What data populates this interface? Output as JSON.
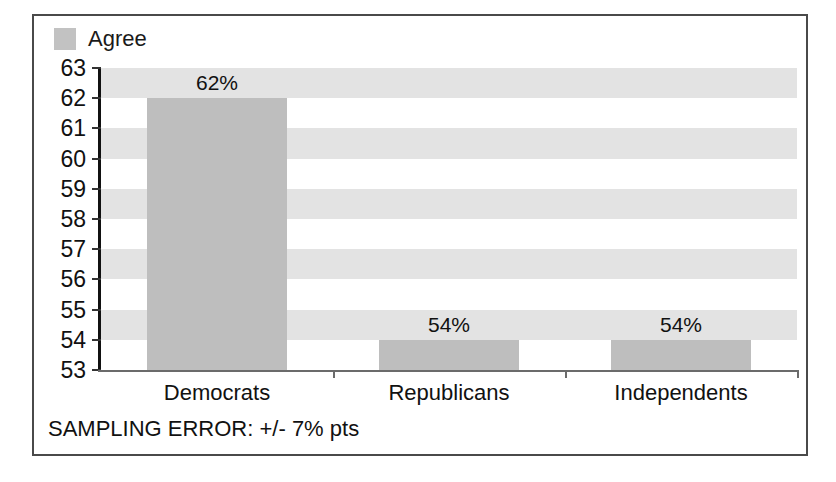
{
  "chart_data": {
    "type": "bar",
    "title": "",
    "subtitle": "",
    "xlabel": "",
    "ylabel": "",
    "categories": [
      "Democrats",
      "Republicans",
      "Independents"
    ],
    "values": [
      62,
      54,
      54
    ],
    "value_labels": [
      "62%",
      "54%",
      "54%"
    ],
    "series": [
      {
        "name": "Agree",
        "values": [
          62,
          54,
          54
        ]
      }
    ],
    "ylim": [
      53,
      63
    ],
    "ytick_step": 1,
    "ytick_labels": [
      "63",
      "62",
      "61",
      "60",
      "59",
      "58",
      "57",
      "56",
      "55",
      "54",
      "53"
    ],
    "grid": false,
    "banded_background": true,
    "legend_position": "top-left",
    "annotation": "SAMPLING ERROR: +/- 7% pts"
  },
  "legend": {
    "entries": [
      {
        "label": "Agree",
        "color": "#c2c2c2"
      }
    ]
  },
  "colors": {
    "bar_fill": "#bebebe",
    "band_gray": "#e3e3e3",
    "band_white": "#ffffff",
    "axis": "#111111",
    "frame_border": "#4a4a4a",
    "text": "#111111"
  },
  "footer": {
    "sampling_error": "SAMPLING ERROR: +/- 7% pts"
  }
}
